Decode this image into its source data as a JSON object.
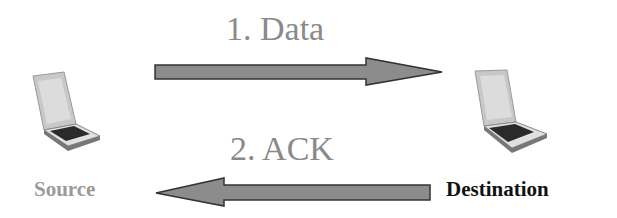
{
  "diagram": {
    "nodes": [
      {
        "id": "source",
        "label": "Source",
        "icon": "laptop-icon"
      },
      {
        "id": "destination",
        "label": "Destination",
        "icon": "laptop-icon"
      }
    ],
    "edges": [
      {
        "from": "source",
        "to": "destination",
        "label": "1. Data"
      },
      {
        "from": "destination",
        "to": "source",
        "label": "2. ACK"
      }
    ],
    "colors": {
      "arrow": "#8c8c8c",
      "arrow_border": "#333333",
      "label": "#8a8a8a",
      "source_text": "#9a9a9a",
      "destination_text": "#111111"
    }
  }
}
